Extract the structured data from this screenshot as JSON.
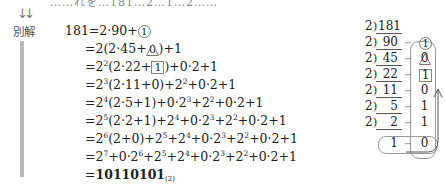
{
  "header": {
    "cut_text": "……れを…181…2…1…2……",
    "arrow_icon": "↓↓",
    "alt_label": "別解"
  },
  "equation": {
    "lines": [
      {
        "lhs": "181",
        "rhs_html": "=2·90+"
      },
      {
        "lhs": "",
        "rhs": "=2(2·45+"
      },
      {
        "lhs": "",
        "rhs": "=2"
      },
      {
        "lhs": "",
        "rhs": "=2"
      },
      {
        "lhs": "",
        "rhs": "=2"
      },
      {
        "lhs": "",
        "rhs": "=2"
      },
      {
        "lhs": "",
        "rhs": "=2"
      },
      {
        "lhs": "",
        "rhs": "=2"
      },
      {
        "lhs": "",
        "rhs": "=10110101"
      }
    ],
    "texts": [
      "181=2·90+①",
      "=2(2·45+0)+1",
      "=2²(2·22+1)+0·2+1",
      "=2³(2·11+0)+2²+0·2+1",
      "=2⁴(2·5+1)+0·2³+2²+0·2+1",
      "=2⁵(2·2+1)+2⁴+0·2³+2²+0·2+1",
      "=2⁶(2+0)+2⁵+2⁴+0·2³+2²+0·2+1",
      "=2⁷+0·2⁶+2⁵+2⁴+0·2³+2²+0·2+1",
      "=10110101₍₂₎"
    ],
    "result": "10110101",
    "result_base": "(2)"
  },
  "division": {
    "divisor": "2",
    "rows": [
      {
        "quotient": "181",
        "remainder": ""
      },
      {
        "quotient": "90",
        "remainder": "1",
        "mark": "circle"
      },
      {
        "quotient": "45",
        "remainder": "0",
        "mark": "triangle"
      },
      {
        "quotient": "22",
        "remainder": "1",
        "mark": "square"
      },
      {
        "quotient": "11",
        "remainder": "0"
      },
      {
        "quotient": "5",
        "remainder": "1"
      },
      {
        "quotient": "2",
        "remainder": "1"
      },
      {
        "quotient": "1",
        "remainder": "0"
      }
    ],
    "dots": "···",
    "up_arrow_icon": "↑"
  }
}
